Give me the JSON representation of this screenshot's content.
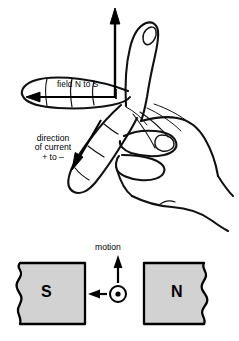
{
  "figure": {
    "background_color": "#ffffff",
    "ink_color": "#000000",
    "magnet_fill_color": "#d2d2d2"
  },
  "hand": {
    "thumb_arrow": {
      "name": "thumb-motion-arrow",
      "direction": "up"
    },
    "index_arrow": {
      "name": "index-field-arrow",
      "direction": "left",
      "label": "field N to S"
    },
    "middle_arrow": {
      "name": "middle-current-arrow",
      "direction": "down-left",
      "label_lines": [
        "direction",
        "of current",
        "+ to –"
      ]
    }
  },
  "labels": {
    "field": "field N to S",
    "current_line1": "direction",
    "current_line2": "of current",
    "current_line3": "+ to –",
    "motion": "motion"
  },
  "magnets": {
    "left": {
      "pole": "S",
      "broken_edge": "left"
    },
    "right": {
      "pole": "N",
      "broken_edge": "right"
    }
  },
  "conductor": {
    "symbol": "⊙",
    "meaning": "current out of page",
    "motion_arrow_direction": "up",
    "force_arrow_direction": "left"
  }
}
